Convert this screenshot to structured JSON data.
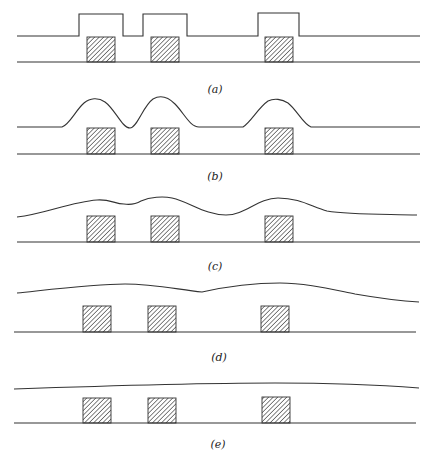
{
  "figure": {
    "colors": {
      "stroke": "#333333",
      "background": "#ffffff",
      "hatch": "#333333"
    },
    "panels": [
      {
        "id": "a",
        "label": "(a)",
        "profile": "conformal-step",
        "description": "Stepped (rectangular) bumps directly above features"
      },
      {
        "id": "b",
        "label": "(b)",
        "profile": "rounded-bumps",
        "description": "Rounded bumps above features"
      },
      {
        "id": "c",
        "label": "(c)",
        "profile": "partially-planarized",
        "description": "Bumps merging, partially planarized"
      },
      {
        "id": "d",
        "label": "(d)",
        "profile": "mostly-planarized",
        "description": "Gentle undulations"
      },
      {
        "id": "e",
        "label": "(e)",
        "profile": "planarized",
        "description": "Nearly flat surface"
      }
    ],
    "features_per_panel": 3,
    "feature_fill": "diagonal-hatch"
  }
}
